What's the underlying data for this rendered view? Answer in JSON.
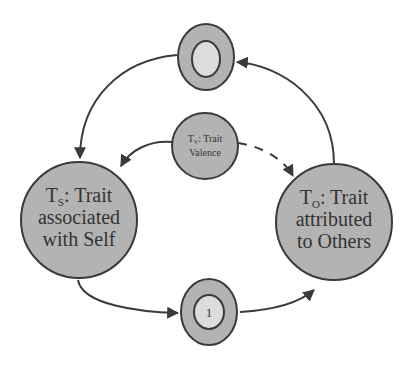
{
  "diagram": {
    "colors": {
      "node_fill": "#b3b3b3",
      "inner_fill": "#dcdcdc",
      "stroke": "#3a3a3a",
      "text": "#333333",
      "background": "#ffffff"
    },
    "nodes": {
      "top": {
        "label": ""
      },
      "valence": {
        "prefix": "T",
        "subscript": "V",
        "line1_rest": ": Trait",
        "line2": "Valence"
      },
      "self": {
        "prefix": "T",
        "subscript": "S",
        "line1_rest": ": Trait",
        "line2": "associated",
        "line3": "with Self"
      },
      "others": {
        "prefix": "T",
        "subscript": "O",
        "line1_rest": ": Trait",
        "line2": "attributed",
        "line3": "to Others"
      },
      "bottom": {
        "label": "1"
      }
    },
    "edges": [
      {
        "from": "top",
        "to": "self",
        "style": "solid"
      },
      {
        "from": "valence",
        "to": "self",
        "style": "solid"
      },
      {
        "from": "valence",
        "to": "others",
        "style": "dashed"
      },
      {
        "from": "others",
        "to": "top",
        "style": "solid"
      },
      {
        "from": "self",
        "to": "bottom",
        "style": "solid"
      },
      {
        "from": "bottom",
        "to": "others",
        "style": "solid"
      }
    ]
  }
}
